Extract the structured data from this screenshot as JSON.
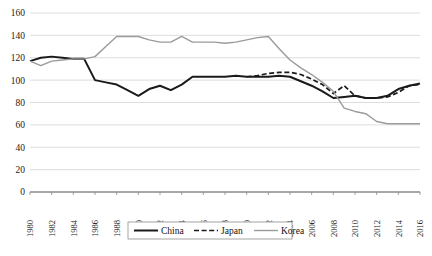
{
  "chart_data": {
    "type": "line",
    "title": "",
    "xlabel": "",
    "ylabel": "",
    "x": [
      1980,
      1981,
      1982,
      1983,
      1984,
      1985,
      1986,
      1987,
      1988,
      1989,
      1990,
      1991,
      1992,
      1993,
      1994,
      1995,
      1996,
      1997,
      1998,
      1999,
      2000,
      2001,
      2002,
      2003,
      2004,
      2005,
      2006,
      2007,
      2008,
      2009,
      2010,
      2011,
      2012,
      2013,
      2014,
      2015,
      2016
    ],
    "xlim": [
      1980,
      2016
    ],
    "ylim": [
      0,
      160
    ],
    "ytick_values": [
      0,
      20,
      40,
      60,
      80,
      100,
      120,
      140,
      160
    ],
    "xtick_values": [
      1980,
      1982,
      1984,
      1986,
      1988,
      1990,
      1992,
      1994,
      1996,
      1998,
      2000,
      2002,
      2004,
      2006,
      2008,
      2010,
      2012,
      2014,
      2016
    ],
    "grid": true,
    "legend_position": "bottom-center",
    "series": [
      {
        "name": "China",
        "style": "solid",
        "color": "#1a1a1a",
        "x": [
          1980,
          1981,
          1982,
          1983,
          1984,
          1985,
          1986,
          1987,
          1988,
          1989,
          1990,
          1991,
          1992,
          1993,
          1994,
          1995,
          1996,
          1997,
          1998,
          1999,
          2000,
          2001,
          2002,
          2003,
          2004,
          2005,
          2006,
          2007,
          2008,
          2009,
          2010,
          2011,
          2012,
          2013,
          2014,
          2015,
          2016
        ],
        "values": [
          117,
          120,
          121,
          120,
          119,
          119,
          100,
          98,
          96,
          91,
          86,
          92,
          95,
          91,
          96,
          103,
          103,
          103,
          103,
          104,
          103,
          103,
          103,
          104,
          103,
          99,
          95,
          90,
          84,
          85,
          86,
          84,
          84,
          86,
          92,
          95,
          97
        ]
      },
      {
        "name": "Japan",
        "style": "dashed",
        "color": "#1a1a1a",
        "x": [
          2000,
          2001,
          2002,
          2003,
          2004,
          2005,
          2006,
          2007,
          2008,
          2009,
          2010,
          2011,
          2012,
          2013,
          2014,
          2015,
          2016
        ],
        "values": [
          103,
          104,
          106,
          107,
          107,
          105,
          101,
          96,
          88,
          95,
          86,
          84,
          84,
          85,
          89,
          95,
          96
        ]
      },
      {
        "name": "Korea",
        "style": "solid",
        "color": "#9b9b9b",
        "x": [
          1980,
          1981,
          1982,
          1983,
          1984,
          1985,
          1986,
          1987,
          1988,
          1989,
          1990,
          1991,
          1992,
          1993,
          1994,
          1995,
          1996,
          1997,
          1998,
          1999,
          2000,
          2001,
          2002,
          2003,
          2004,
          2005,
          2006,
          2007,
          2008,
          2009,
          2010,
          2011,
          2012,
          2013,
          2014,
          2015,
          2016
        ],
        "values": [
          117,
          113,
          117,
          118,
          119,
          119,
          121,
          130,
          139,
          139,
          139,
          136,
          134,
          134,
          139,
          134,
          134,
          134,
          133,
          134,
          136,
          138,
          139,
          128,
          118,
          111,
          105,
          98,
          90,
          75,
          72,
          70,
          63,
          61,
          61,
          61,
          61
        ]
      }
    ]
  },
  "legend": {
    "items": [
      {
        "label": "China",
        "style": "solid",
        "color": "#1a1a1a"
      },
      {
        "label": "Japan",
        "style": "dashed",
        "color": "#1a1a1a"
      },
      {
        "label": "Korea",
        "style": "solid",
        "color": "#9b9b9b"
      }
    ]
  }
}
